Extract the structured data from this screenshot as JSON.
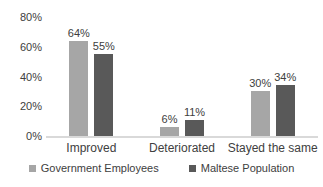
{
  "chart_data": {
    "type": "bar",
    "categories": [
      "Improved",
      "Deteriorated",
      "Stayed the same"
    ],
    "series": [
      {
        "name": "Government Employees",
        "color": "#a6a6a6",
        "values": [
          64,
          6,
          30
        ]
      },
      {
        "name": "Maltese Population",
        "color": "#595959",
        "values": [
          55,
          11,
          34
        ]
      }
    ],
    "data_labels": [
      [
        "64%",
        "6%",
        "30%"
      ],
      [
        "55%",
        "11%",
        "34%"
      ]
    ],
    "title": "",
    "xlabel": "",
    "ylabel": "",
    "ylim": [
      0,
      80
    ],
    "yticks": [
      "0%",
      "20%",
      "40%",
      "60%",
      "80%"
    ],
    "grid": false,
    "legend_position": "bottom",
    "axis_line_color": "#d9d9d9",
    "text_color": "#404040",
    "background_color": "#ffffff"
  }
}
